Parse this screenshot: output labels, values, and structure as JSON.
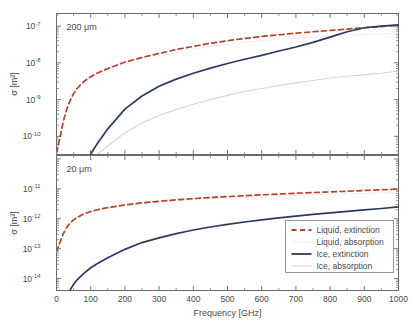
{
  "figure": {
    "title": "",
    "background_color": "#ffffff",
    "axis_color": "#6b6b6b",
    "text_color": "#4a4a4a"
  },
  "colors": {
    "liquid_extinction": "#b4432e",
    "liquid_absorption": "#e8e8e8",
    "ice_extinction": "#2c3a63",
    "ice_absorption": "#d6d6d6"
  },
  "legend": {
    "position": "lower-right",
    "entries": [
      {
        "label": "Liquid, extinction",
        "color": "#b4432e",
        "style": "dashed",
        "swatch": "dashed-line-swatch"
      },
      {
        "label": "Liquid, absorption",
        "color": "#f2f2f2",
        "style": "solid",
        "swatch": "faint-line-swatch"
      },
      {
        "label": "Ice, extinction",
        "color": "#2c3a63",
        "style": "solid",
        "swatch": "solid-line-swatch"
      },
      {
        "label": "Ice, absorption",
        "color": "#d6d6d6",
        "style": "solid",
        "swatch": "light-line-swatch"
      }
    ]
  },
  "axes": {
    "xlabel": "Frequency [GHz]",
    "ylabel_sigma": "σ",
    "ylabel_units": "[m²]",
    "ylabel": "σ [m²]",
    "xticks": [
      0,
      100,
      200,
      300,
      400,
      500,
      600,
      700,
      800,
      900,
      1000
    ],
    "xtick_labels": [
      "0",
      "100",
      "200",
      "300",
      "400",
      "500",
      "600",
      "700",
      "800",
      "900",
      "1000"
    ],
    "xlim": [
      0,
      1000
    ]
  },
  "chart_data": [
    {
      "id": "panel-top",
      "type": "line",
      "title": "",
      "annotation": "200 μm",
      "xlabel": "",
      "ylabel": "σ [m²]",
      "xlim": [
        0,
        1000
      ],
      "ylim": [
        3.2e-11,
        2.2e-07
      ],
      "yscale": "log",
      "ytick_labels": [
        "10⁻⁷",
        "10⁻⁸",
        "10⁻⁹",
        "10⁻¹⁰"
      ],
      "ytick_mantissa": [
        "10",
        "10",
        "10",
        "10"
      ],
      "ytick_exponents": [
        "-7",
        "-8",
        "-9",
        "-10"
      ],
      "yticks": [
        1e-07,
        1e-08,
        1e-09,
        1e-10
      ],
      "grid": false,
      "x": [
        0,
        10,
        20,
        30,
        40,
        50,
        60,
        80,
        100,
        120,
        150,
        200,
        250,
        300,
        350,
        400,
        450,
        500,
        550,
        600,
        650,
        700,
        750,
        800,
        850,
        900,
        950,
        1000
      ],
      "series": [
        {
          "name": "Liquid, extinction",
          "color": "#b4432e",
          "style": "dashed",
          "values": [
            3.5e-11,
            9e-11,
            2.6e-10,
            5.5e-10,
            9.5e-10,
            1.45e-09,
            2e-09,
            3.1e-09,
            4.2e-09,
            5.3e-09,
            7e-09,
            1.05e-08,
            1.4e-08,
            1.8e-08,
            2.3e-08,
            2.8e-08,
            3.4e-08,
            4e-08,
            4.6e-08,
            5.2e-08,
            5.8e-08,
            6.4e-08,
            7e-08,
            7.6e-08,
            8.3e-08,
            9e-08,
            9.7e-08,
            1.05e-07
          ]
        },
        {
          "name": "Liquid, absorption",
          "color": "#f2f2f2",
          "style": "solid",
          "values": [
            3.3e-11,
            8.4e-11,
            2.4e-10,
            5.1e-10,
            8.8e-10,
            1.33e-09,
            1.85e-09,
            2.85e-09,
            3.85e-09,
            4.8e-09,
            6.3e-09,
            9.3e-09,
            1.23e-08,
            1.55e-08,
            1.95e-08,
            2.35e-08,
            2.8e-08,
            3.25e-08,
            3.65e-08,
            4.05e-08,
            4.4e-08,
            4.7e-08,
            5e-08,
            5.3e-08,
            5.6e-08,
            5.9e-08,
            6.2e-08,
            6.5e-08
          ]
        },
        {
          "name": "Ice, extinction",
          "color": "#2c3a63",
          "style": "solid",
          "values": [
            null,
            null,
            null,
            null,
            null,
            null,
            null,
            null,
            3.3e-11,
            6.5e-11,
            1.6e-10,
            5.5e-10,
            1.25e-09,
            2.3e-09,
            3.6e-09,
            5.2e-09,
            7.2e-09,
            9.6e-09,
            1.25e-08,
            1.6e-08,
            2.1e-08,
            2.7e-08,
            3.6e-08,
            5e-08,
            7e-08,
            9e-08,
            1e-07,
            1.08e-07
          ]
        },
        {
          "name": "Ice, absorption",
          "color": "#d6d6d6",
          "style": "solid",
          "values": [
            null,
            null,
            null,
            null,
            null,
            null,
            null,
            null,
            null,
            3.3e-11,
            5.5e-11,
            1.25e-10,
            2.3e-10,
            3.7e-10,
            5.4e-10,
            7.5e-10,
            1e-09,
            1.3e-09,
            1.65e-09,
            2e-09,
            2.4e-09,
            2.85e-09,
            3.3e-09,
            3.85e-09,
            4.3e-09,
            4.7e-09,
            5.2e-09,
            6e-09
          ]
        }
      ]
    },
    {
      "id": "panel-bottom",
      "type": "line",
      "title": "",
      "annotation": "20 μm",
      "xlabel": "Frequency [GHz]",
      "ylabel": "σ [m²]",
      "xlim": [
        0,
        1000
      ],
      "ylim": [
        4e-15,
        1.3e-10
      ],
      "yscale": "log",
      "ytick_labels": [
        "10⁻¹¹",
        "10⁻¹²",
        "10⁻¹³",
        "10⁻¹⁴"
      ],
      "ytick_mantissa": [
        "10",
        "10",
        "10",
        "10"
      ],
      "ytick_exponents": [
        "-11",
        "-12",
        "-13",
        "-14"
      ],
      "yticks": [
        1e-11,
        1e-12,
        1e-13,
        1e-14
      ],
      "grid": false,
      "x": [
        0,
        10,
        20,
        30,
        40,
        50,
        60,
        80,
        100,
        120,
        150,
        200,
        250,
        300,
        350,
        400,
        450,
        500,
        550,
        600,
        650,
        700,
        750,
        800,
        850,
        900,
        950,
        1000
      ],
      "series": [
        {
          "name": "Liquid, extinction",
          "color": "#b4432e",
          "style": "dashed",
          "values": [
            8e-14,
            1.6e-13,
            3.2e-13,
            5.2e-13,
            7.2e-13,
            9.2e-13,
            1.1e-12,
            1.45e-12,
            1.75e-12,
            2e-12,
            2.35e-12,
            2.9e-12,
            3.4e-12,
            3.85e-12,
            4.3e-12,
            4.7e-12,
            5.1e-12,
            5.5e-12,
            5.9e-12,
            6.3e-12,
            6.7e-12,
            7.1e-12,
            7.5e-12,
            7.9e-12,
            8.3e-12,
            8.8e-12,
            9.3e-12,
            9.8e-12
          ]
        },
        {
          "name": "Liquid, absorption",
          "color": "#f2f2f2",
          "style": "solid",
          "values": [
            7.8e-14,
            1.55e-13,
            3.1e-13,
            5e-13,
            6.9e-13,
            8.8e-13,
            1.05e-12,
            1.38e-12,
            1.65e-12,
            1.9e-12,
            2.2e-12,
            2.7e-12,
            3.15e-12,
            3.55e-12,
            3.95e-12,
            4.3e-12,
            4.6e-12,
            4.9e-12,
            5.2e-12,
            5.5e-12,
            5.8e-12,
            6.05e-12,
            6.3e-12,
            6.55e-12,
            6.8e-12,
            7.05e-12,
            7.3e-12,
            7.55e-12
          ]
        },
        {
          "name": "Ice, extinction",
          "color": "#2c3a63",
          "style": "solid",
          "values": [
            null,
            null,
            null,
            null,
            4.2e-15,
            6.5e-15,
            9e-15,
            1.5e-14,
            2.3e-14,
            3.2e-14,
            5e-14,
            9.5e-14,
            1.6e-13,
            2.3e-13,
            3.2e-13,
            4.2e-13,
            5.3e-13,
            6.5e-13,
            7.8e-13,
            9.2e-13,
            1.07e-12,
            1.23e-12,
            1.4e-12,
            1.58e-12,
            1.77e-12,
            1.97e-12,
            2.2e-12,
            2.5e-12
          ]
        },
        {
          "name": "Ice, absorption",
          "color": "#d6d6d6",
          "style": "solid",
          "values": [
            null,
            null,
            null,
            null,
            null,
            null,
            null,
            null,
            null,
            null,
            null,
            null,
            null,
            null,
            null,
            null,
            null,
            null,
            null,
            null,
            null,
            null,
            null,
            null,
            null,
            null,
            null,
            null
          ]
        }
      ]
    }
  ]
}
